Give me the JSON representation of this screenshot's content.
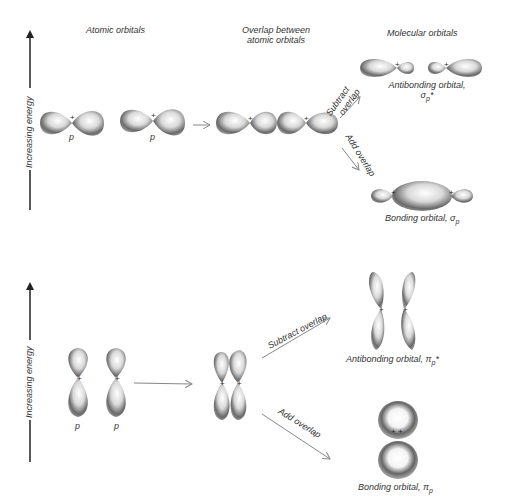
{
  "top_panel": {
    "axis_label": "Increasing energy",
    "headers": {
      "atomic": "Atomic orbitals",
      "overlap_line1": "Overlap between",
      "overlap_line2": "atomic orbitals",
      "molecular": "Molecular orbitals"
    },
    "atomic_labels": [
      "p",
      "p"
    ],
    "plus_sign": "+",
    "subtract_label_line1": "Subtract",
    "subtract_label_line2": "overlap",
    "add_label": "Add overlap",
    "antibonding_label_line1": "Antibonding orbital,",
    "antibonding_symbol": "σ",
    "antibonding_sub": "p",
    "antibonding_star": "*",
    "bonding_label": "Bonding orbital, ",
    "bonding_symbol": "σ",
    "bonding_sub": "p"
  },
  "bottom_panel": {
    "axis_label": "Increasing energy",
    "atomic_labels": [
      "p",
      "p"
    ],
    "subtract_label": "Subtract overlap",
    "add_label": "Add overlap",
    "antibonding_label": "Antibonding orbital, ",
    "antibonding_symbol": "π",
    "antibonding_sub": "p",
    "antibonding_star": "*",
    "bonding_label": "Bonding orbital, ",
    "bonding_symbol": "π",
    "bonding_sub": "p"
  },
  "colors": {
    "lobe_dark": "#3a3a3a",
    "lobe_light": "#e8e8e8",
    "arrow": "#888888",
    "axis": "#222222"
  }
}
